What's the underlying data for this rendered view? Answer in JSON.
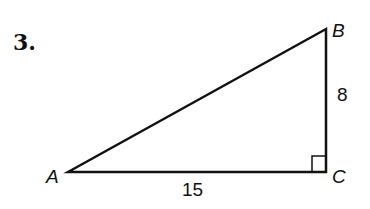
{
  "problem": {
    "number": "3."
  },
  "triangle": {
    "vertices": {
      "A": {
        "label": "A"
      },
      "B": {
        "label": "B"
      },
      "C": {
        "label": "C"
      }
    },
    "sides": {
      "BC": {
        "label": "8"
      },
      "AC": {
        "label": "15"
      }
    },
    "right_angle_at": "C",
    "stroke_color": "#111111"
  }
}
